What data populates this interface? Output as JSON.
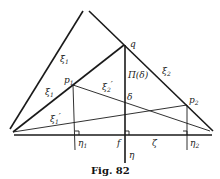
{
  "figure": {
    "caption": "Fig. 82",
    "labels": {
      "xi1_bar": "ξ̄",
      "xi1_bar_sub": "1",
      "xi1": "ξ",
      "xi1_sub": "1",
      "xi2": "ξ",
      "xi2_sub": "2",
      "xi1_prime": "ξ",
      "xi1_prime_sub": "1",
      "xi1_prime_mark": "′",
      "xi2_prime": "ξ",
      "xi2_prime_sub": "2",
      "xi2_prime_mark": "′",
      "q": "q",
      "p1": "p",
      "p1_sub": "1",
      "p2": "p",
      "p2_sub": "2",
      "pi_delta": "Π(δ)",
      "delta": "δ",
      "f": "f",
      "zeta": "ζ",
      "eta": "η",
      "eta1": "η",
      "eta1_sub": "1",
      "eta2": "η",
      "eta2_sub": "2"
    },
    "points": {
      "q": [
        124,
        45
      ],
      "p1": [
        73,
        85
      ],
      "p2": [
        187,
        105
      ],
      "f": [
        125,
        135
      ],
      "left_vertex": [
        13,
        132
      ]
    }
  }
}
